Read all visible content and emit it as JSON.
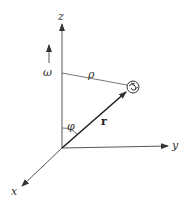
{
  "diagram": {
    "labels": {
      "z_axis": "z",
      "y_axis": "y",
      "x_axis": "x",
      "omega": "ω",
      "rho": "ρ",
      "r_vector": "r",
      "phi": "φ"
    },
    "colors": {
      "ink": "#333333",
      "background": "#ffffff"
    }
  }
}
